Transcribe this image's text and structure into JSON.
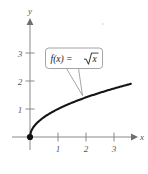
{
  "figure": {
    "background_color": "#ffffff",
    "curve_color": "#151515",
    "axis_color": "#8a8a8a",
    "label_color": "#55555a"
  },
  "axes": {
    "x": {
      "name": "x",
      "ticks": [
        "1",
        "2",
        "3"
      ],
      "tick_values": [
        1,
        2,
        3
      ],
      "range": [
        -0.2,
        3.9
      ],
      "arrow": true
    },
    "y": {
      "name": "y",
      "ticks": [
        "1",
        "2",
        "3"
      ],
      "tick_values": [
        1,
        2,
        3
      ],
      "range": [
        -0.35,
        3.9
      ],
      "arrow": true
    }
  },
  "callout": {
    "function_prefix": "f(x) =",
    "radicand": "x",
    "full_label": "f(x) = √x"
  },
  "origin_point": {
    "label": "origin-point",
    "x": 0,
    "y": 0
  },
  "chart_data": {
    "type": "line",
    "title": "",
    "subtitle": "",
    "xlabel": "x",
    "ylabel": "y",
    "xlim": [
      -0.2,
      3.9
    ],
    "ylim": [
      -0.35,
      3.9
    ],
    "xticks": [
      1,
      2,
      3
    ],
    "yticks": [
      1,
      2,
      3
    ],
    "grid": false,
    "legend": false,
    "annotations": [
      {
        "text": "f(x) = √x",
        "type": "callout",
        "points_to_x": 1.9,
        "points_to_y": 1.38
      }
    ],
    "series": [
      {
        "name": "f(x) = √x",
        "formula": "sqrt(x)",
        "color": "#151515",
        "x": [
          0,
          0.1,
          0.2,
          0.3,
          0.4,
          0.5,
          0.75,
          1,
          1.25,
          1.5,
          1.75,
          2,
          2.25,
          2.5,
          2.75,
          3,
          3.25,
          3.5,
          3.6
        ],
        "y": [
          0,
          0.316,
          0.447,
          0.548,
          0.632,
          0.707,
          0.866,
          1,
          1.118,
          1.225,
          1.323,
          1.414,
          1.5,
          1.581,
          1.658,
          1.732,
          1.803,
          1.871,
          1.897
        ]
      }
    ],
    "markers": [
      {
        "name": "origin",
        "x": 0,
        "y": 0,
        "style": "filled-circle",
        "color": "#111111"
      }
    ]
  }
}
